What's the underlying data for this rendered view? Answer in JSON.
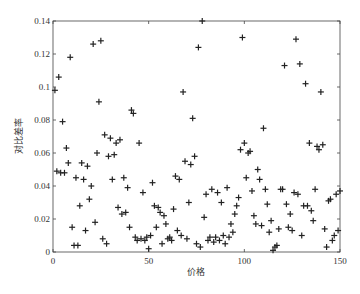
{
  "chart_data": {
    "type": "scatter",
    "title": "",
    "xlabel": "价格",
    "ylabel": "对比差率",
    "xlim": [
      0,
      150
    ],
    "ylim": [
      0,
      0.14
    ],
    "xticks": [
      0,
      50,
      100,
      150
    ],
    "yticks": [
      0,
      0.02,
      0.04,
      0.06,
      0.08,
      0.1,
      0.12,
      0.14
    ],
    "ytick_labels": [
      "0",
      "0.02",
      "0.04",
      "0.06",
      "0.08",
      "0.1",
      "0.12",
      "0.14"
    ],
    "grid": false,
    "legend": null,
    "marker": "+",
    "series": [
      {
        "name": "对比差率",
        "points": [
          [
            1,
            0.098
          ],
          [
            2,
            0.049
          ],
          [
            3,
            0.106
          ],
          [
            4,
            0.048
          ],
          [
            5,
            0.079
          ],
          [
            6,
            0.048
          ],
          [
            7,
            0.063
          ],
          [
            8,
            0.054
          ],
          [
            9,
            0.118
          ],
          [
            10,
            0.015
          ],
          [
            11,
            0.004
          ],
          [
            12,
            0.045
          ],
          [
            13,
            0.004
          ],
          [
            14,
            0.028
          ],
          [
            15,
            0.054
          ],
          [
            16,
            0.044
          ],
          [
            17,
            0.013
          ],
          [
            18,
            0.052
          ],
          [
            19,
            0.032
          ],
          [
            20,
            0.04
          ],
          [
            21,
            0.126
          ],
          [
            22,
            0.018
          ],
          [
            23,
            0.06
          ],
          [
            24,
            0.091
          ],
          [
            25,
            0.128
          ],
          [
            26,
            0.008
          ],
          [
            27,
            0.071
          ],
          [
            28,
            0.005
          ],
          [
            29,
            0.058
          ],
          [
            30,
            0.069
          ],
          [
            31,
            0.044
          ],
          [
            32,
            0.059
          ],
          [
            33,
            0.066
          ],
          [
            34,
            0.027
          ],
          [
            35,
            0.068
          ],
          [
            36,
            0.023
          ],
          [
            37,
            0.045
          ],
          [
            38,
            0.024
          ],
          [
            39,
            0.039
          ],
          [
            40,
            0.015
          ],
          [
            41,
            0.086
          ],
          [
            42,
            0.084
          ],
          [
            43,
            0.009
          ],
          [
            44,
            0.007
          ],
          [
            45,
            0.066
          ],
          [
            46,
            0.008
          ],
          [
            47,
            0.036
          ],
          [
            48,
            0.007
          ],
          [
            49,
            0.009
          ],
          [
            50,
            0.002
          ],
          [
            51,
            0.01
          ],
          [
            52,
            0.042
          ],
          [
            53,
            0.028
          ],
          [
            54,
            0.015
          ],
          [
            55,
            0.027
          ],
          [
            56,
            0.024
          ],
          [
            57,
            0.005
          ],
          [
            58,
            0.022
          ],
          [
            59,
            0.017
          ],
          [
            60,
            0.008
          ],
          [
            61,
            0.009
          ],
          [
            62,
            0.007
          ],
          [
            63,
            0.026
          ],
          [
            64,
            0.046
          ],
          [
            65,
            0.013
          ],
          [
            66,
            0.044
          ],
          [
            67,
            0.01
          ],
          [
            68,
            0.097
          ],
          [
            69,
            0.055
          ],
          [
            70,
            0.008
          ],
          [
            71,
            0.03
          ],
          [
            72,
            0.053
          ],
          [
            73,
            0.081
          ],
          [
            74,
            0.058
          ],
          [
            75,
            0.005
          ],
          [
            76,
            0.124
          ],
          [
            77,
            0.003
          ],
          [
            78,
            0.14
          ],
          [
            79,
            0.021
          ],
          [
            80,
            0.035
          ],
          [
            81,
            0.007
          ],
          [
            82,
            0.009
          ],
          [
            83,
            0.038
          ],
          [
            84,
            0.006
          ],
          [
            85,
            0.009
          ],
          [
            86,
            0.036
          ],
          [
            87,
            0.007
          ],
          [
            88,
            0.03
          ],
          [
            89,
            0.01
          ],
          [
            90,
            0.005
          ],
          [
            91,
            0.039
          ],
          [
            92,
            0.009
          ],
          [
            93,
            0.017
          ],
          [
            94,
            0.012
          ],
          [
            95,
            0.023
          ],
          [
            96,
            0.028
          ],
          [
            97,
            0.033
          ],
          [
            98,
            0.062
          ],
          [
            99,
            0.13
          ],
          [
            100,
            0.066
          ],
          [
            101,
            0.045
          ],
          [
            102,
            0.06
          ],
          [
            103,
            0.061
          ],
          [
            104,
            0.037
          ],
          [
            105,
            0.022
          ],
          [
            106,
            0.017
          ],
          [
            107,
            0.05
          ],
          [
            108,
            0.044
          ],
          [
            109,
            0.016
          ],
          [
            110,
            0.075
          ],
          [
            111,
            0.038
          ],
          [
            112,
            0.029
          ],
          [
            113,
            0.012
          ],
          [
            114,
            0.019
          ],
          [
            115,
            0.001
          ],
          [
            116,
            0.003
          ],
          [
            117,
            0.004
          ],
          [
            118,
            0.014
          ],
          [
            119,
            0.038
          ],
          [
            120,
            0.038
          ],
          [
            121,
            0.113
          ],
          [
            122,
            0.029
          ],
          [
            123,
            0.015
          ],
          [
            124,
            0.023
          ],
          [
            125,
            0.013
          ],
          [
            126,
            0.036
          ],
          [
            127,
            0.129
          ],
          [
            128,
            0.035
          ],
          [
            129,
            0.114
          ],
          [
            130,
            0.01
          ],
          [
            131,
            0.028
          ],
          [
            132,
            0.102
          ],
          [
            133,
            0.028
          ],
          [
            134,
            0.066
          ],
          [
            135,
            0.025
          ],
          [
            136,
            0.019
          ],
          [
            137,
            0.038
          ],
          [
            138,
            0.064
          ],
          [
            139,
            0.062
          ],
          [
            140,
            0.097
          ],
          [
            141,
            0.065
          ],
          [
            142,
            0.014
          ],
          [
            143,
            0.003
          ],
          [
            144,
            0.031
          ],
          [
            145,
            0.032
          ],
          [
            146,
            0.007
          ],
          [
            147,
            0.01
          ],
          [
            148,
            0.035
          ],
          [
            149,
            0.013
          ],
          [
            150,
            0.037
          ]
        ]
      }
    ]
  }
}
